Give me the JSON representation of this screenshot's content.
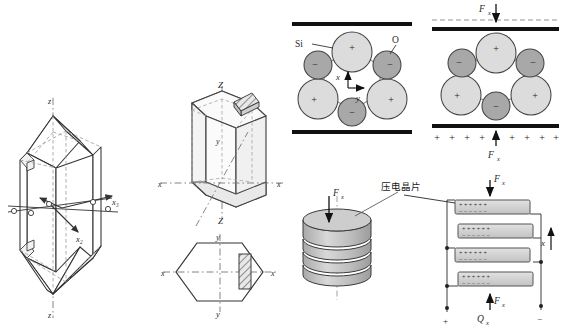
{
  "figure": {
    "panels": [
      {
        "id": "natural-quartz-crystal",
        "name": "Natural quartz crystal with electrical axes"
      },
      {
        "id": "hexagonal-prism",
        "name": "Hexagonal prism cut orientation"
      },
      {
        "id": "hexagon-cross-section",
        "name": "Hexagonal cross-section with wafer"
      },
      {
        "id": "sio2-lattice-unstressed",
        "name": "SiO2 lattice unstressed"
      },
      {
        "id": "sio2-lattice-stressed",
        "name": "SiO2 lattice under force Fx"
      },
      {
        "id": "crystal-wafer-stack",
        "name": "Stacked piezoelectric wafers"
      },
      {
        "id": "wafer-circuit",
        "name": "Parallel-connected wafer charge diagram"
      }
    ]
  },
  "crystal": {
    "axis_top": "z",
    "axis_bottom": "z",
    "axis_x2": "x₂",
    "axis_x3": "x₃"
  },
  "prism": {
    "axis_z_top": "Z",
    "axis_z_bottom": "Z",
    "axis_x_left": "x",
    "axis_x_right": "x",
    "axis_y": "y"
  },
  "hexagon": {
    "axis_y_top": "y",
    "axis_y_bottom": "y",
    "axis_x_left": "x",
    "axis_x_right": "x"
  },
  "lattice_unstressed": {
    "label_si": "Si",
    "label_o": "O",
    "axis_x": "x",
    "axis_y": "y",
    "ion_positive": "+",
    "ion_negative": "−",
    "positive_ions": [
      "+",
      "+",
      "+"
    ],
    "negative_ions": [
      "−",
      "−",
      "−"
    ]
  },
  "lattice_stressed": {
    "force_top": "F",
    "force_top_sub": "x",
    "force_bottom": "F",
    "force_bottom_sub": "x",
    "surface_charges": [
      "+",
      "+",
      "+",
      "+",
      "+",
      "+",
      "+",
      "+",
      "+"
    ],
    "ion_positive": "+",
    "ion_negative": "−"
  },
  "wafer_stack": {
    "force_label": "F",
    "force_sub": "x",
    "callout": "压电晶片"
  },
  "circuit": {
    "force_top": "F",
    "force_top_sub": "x",
    "force_bottom": "F",
    "force_bottom_sub": "x",
    "charge_label": "Q",
    "charge_sub": "x",
    "axis_x": "x",
    "terminal_positive": "+",
    "terminal_negative": "−",
    "plate_rows": [
      {
        "top": "+ + + + + +",
        "bottom": "− − − − − −"
      },
      {
        "top": "+ + + + + +",
        "bottom": "− − − − − −"
      },
      {
        "top": "+ + + + + +",
        "bottom": "− − − − − −"
      },
      {
        "top": "+ + + + + +",
        "bottom": "− − − − − −"
      }
    ]
  },
  "colors": {
    "ion_light": "#dcdcdc",
    "ion_dark": "#a8a8a8",
    "disc_face": "#c8c8c8",
    "disc_side": "#b4b4b4",
    "plate_fill": "#d2d2d2",
    "electrode": "#1a1a1a",
    "stroke": "#333333"
  }
}
